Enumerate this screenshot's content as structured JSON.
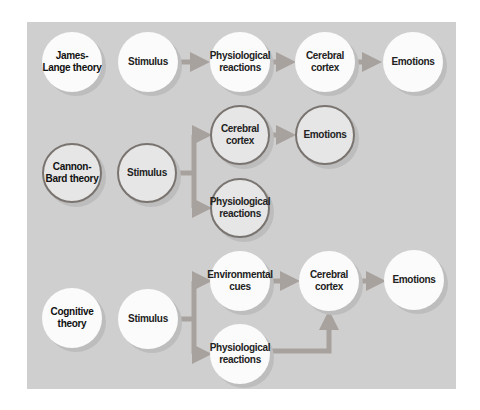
{
  "rows": [
    {
      "theory": "James-Lange theory",
      "nodes": {
        "stimulus": "Stimulus",
        "physiological": "Physiological reactions",
        "cortex": "Cerebral cortex",
        "emotions": "Emotions"
      }
    },
    {
      "theory": "Cannon-Bard theory",
      "nodes": {
        "stimulus": "Stimulus",
        "cortex": "Cerebral cortex",
        "emotions": "Emotions",
        "physiological": "Physiological reactions"
      }
    },
    {
      "theory": "Cognitive theory",
      "nodes": {
        "stimulus": "Stimulus",
        "environmental": "Environmental cues",
        "cortex": "Cerebral cortex",
        "emotions": "Emotions",
        "physiological": "Physiological reactions"
      }
    }
  ],
  "colors": {
    "panel": "#cfcfcf",
    "node_fill": "#fbfbfb",
    "cannon_bard_fill": "#e6e6e6",
    "cannon_bard_border": "#7a7470",
    "arrow": "#a8a29e"
  }
}
